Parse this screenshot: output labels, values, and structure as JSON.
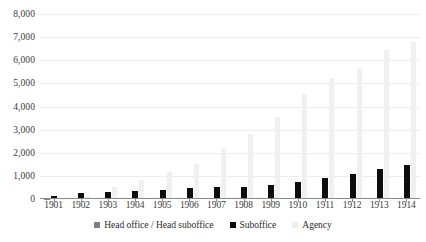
{
  "chart_data": {
    "type": "bar",
    "title": "",
    "subtitle": "",
    "xlabel": "",
    "ylabel": "",
    "ylim": [
      0,
      8000
    ],
    "ytick_labels": [
      "8,000",
      "7,000",
      "6,000",
      "5,000",
      "4,000",
      "3,000",
      "2,000",
      "1,000",
      "0"
    ],
    "ytick_values": [
      8000,
      7000,
      6000,
      5000,
      4000,
      3000,
      2000,
      1000,
      0
    ],
    "grid": true,
    "legend_position": "bottom",
    "categories": [
      "1901",
      "1902",
      "1903",
      "1904",
      "1905",
      "1906",
      "1907",
      "1908",
      "1909",
      "1910",
      "1911",
      "1912",
      "1913",
      "1914"
    ],
    "series": [
      {
        "name": "Head office / Head suboffice",
        "color": "#808080",
        "values": [
          20,
          30,
          35,
          40,
          45,
          50,
          50,
          55,
          55,
          60,
          60,
          60,
          65,
          65
        ]
      },
      {
        "name": "Suboffice",
        "color": "#0d0d0d",
        "values": [
          120,
          240,
          300,
          340,
          390,
          470,
          500,
          530,
          600,
          740,
          930,
          1100,
          1300,
          1490
        ]
      },
      {
        "name": "Agency",
        "color": "#efefef",
        "values": [
          60,
          110,
          520,
          820,
          1150,
          1520,
          2190,
          2820,
          3530,
          4520,
          5240,
          5680,
          6450,
          6790
        ]
      }
    ]
  },
  "legend": {
    "items": [
      {
        "label": "Head office / Head suboffice",
        "swatch_class": "sw-head"
      },
      {
        "label": "Suboffice",
        "swatch_class": "sw-sub"
      },
      {
        "label": "Agency",
        "swatch_class": "sw-agency"
      }
    ]
  }
}
